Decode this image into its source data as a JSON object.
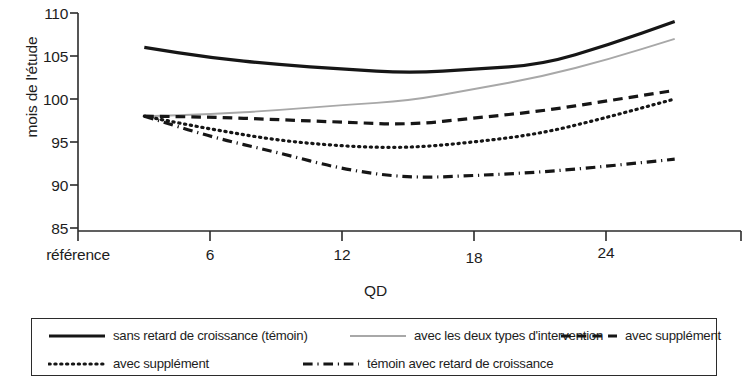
{
  "chart_data": {
    "type": "line",
    "title": "",
    "xlabel": "QD",
    "ylabel": "mois de l'étude",
    "xlim": [
      0,
      30
    ],
    "ylim": [
      85,
      110
    ],
    "grid": false,
    "legend_position": "bottom",
    "x_tick_labels": [
      "référence",
      "6",
      "12",
      "18",
      "24"
    ],
    "x_tick_values": [
      0,
      6,
      12,
      18,
      24
    ],
    "y_tick_labels": [
      "85",
      "90",
      "95",
      "100",
      "105",
      "110"
    ],
    "y_tick_values": [
      85,
      90,
      95,
      100,
      105,
      110
    ],
    "x": [
      3,
      6,
      9,
      12,
      15,
      18,
      21,
      24,
      27
    ],
    "series": [
      {
        "name": "sans retard de croissance (témoin)",
        "style": "solid",
        "color": "#161616",
        "width": 3.2,
        "values": [
          106,
          104.8,
          104,
          103.5,
          103,
          103.5,
          104,
          106.3,
          109
        ]
      },
      {
        "name": "avec les deux types d'intervention",
        "style": "solid-light",
        "color": "#a8a8a8",
        "width": 1.9,
        "values": [
          98,
          98.2,
          98.7,
          99.3,
          99.8,
          101.2,
          102.6,
          104.6,
          107
        ]
      },
      {
        "name": "avec supplément",
        "style": "dashed",
        "color": "#161616",
        "width": 3.2,
        "values": [
          98,
          97.9,
          97.6,
          97.3,
          97,
          97.8,
          98.6,
          99.8,
          101
        ]
      },
      {
        "name": "avec supplément",
        "style": "dotted",
        "color": "#161616",
        "width": 3.2,
        "values": [
          98,
          96.5,
          95.2,
          94.5,
          94.3,
          95,
          96,
          97.9,
          100
        ]
      },
      {
        "name": "témoin avec retard de croissance",
        "style": "dashdot",
        "color": "#161616",
        "width": 3.2,
        "values": [
          98,
          95.6,
          93.8,
          91.8,
          90.8,
          91.1,
          91.5,
          92.2,
          93
        ]
      }
    ],
    "legend": [
      {
        "label": "sans retard de croissance (témoin)",
        "style": "solid",
        "color": "#161616"
      },
      {
        "label": "avec les deux types d'intervention",
        "style": "solid-light",
        "color": "#a8a8a8"
      },
      {
        "label": "avec supplément",
        "style": "dashed",
        "color": "#161616"
      },
      {
        "label": "avec supplément",
        "style": "dotted",
        "color": "#161616"
      },
      {
        "label": "témoin avec retard de croissance",
        "style": "dashdot",
        "color": "#161616"
      }
    ]
  },
  "axis": {
    "y_title": "mois de l'étude",
    "x_title": "QD"
  }
}
